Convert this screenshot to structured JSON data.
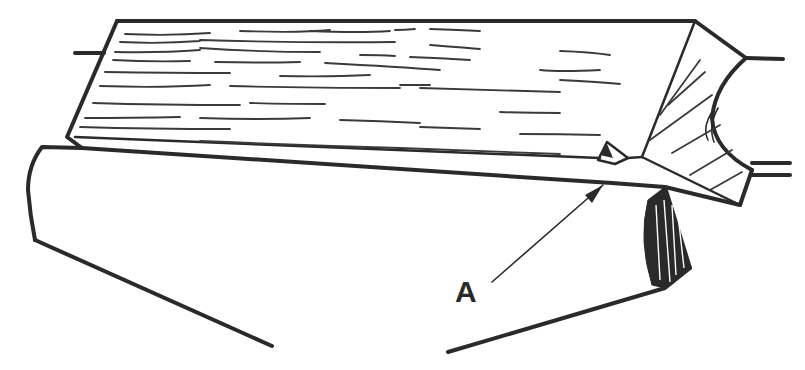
{
  "figure": {
    "type": "technical-illustration",
    "labels": [
      {
        "id": "A",
        "text": "A"
      }
    ],
    "colors": {
      "ink": "#2a2a2a",
      "background": "#ffffff"
    }
  }
}
